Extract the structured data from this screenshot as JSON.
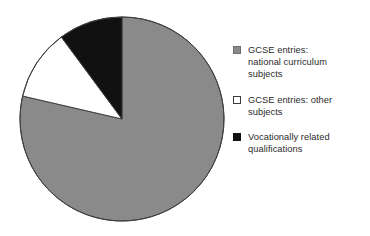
{
  "chart_data": {
    "type": "pie",
    "title": "",
    "subtitle": "",
    "xlabel": "",
    "ylabel": "",
    "grid": false,
    "legend_position": "right",
    "start_angle_deg": 0,
    "direction": "clockwise",
    "categories": [
      "GCSE entries: national curriculum subjects",
      "GCSE entries: other subjects",
      "Vocationally related qualifications"
    ],
    "values": [
      78.6,
      11.3,
      10.1
    ],
    "value_unit": "percent",
    "slice_angles_deg": [
      283.0,
      40.5,
      36.5
    ],
    "colors": [
      "#8a8a8a",
      "#ffffff",
      "#111111"
    ],
    "annotations": []
  },
  "pie": {
    "center_x": 103,
    "center_y": 103,
    "radius": 102,
    "outline_color": "#3f3f3f",
    "slices": [
      {
        "name": "gcse-national-curriculum",
        "start_deg": 0,
        "end_deg": 283.0,
        "fill": "#8a8a8a"
      },
      {
        "name": "gcse-other-subjects",
        "start_deg": 283.0,
        "end_deg": 323.5,
        "fill": "#ffffff"
      },
      {
        "name": "vocationally-related-qualifications",
        "start_deg": 323.5,
        "end_deg": 360,
        "fill": "#111111"
      }
    ]
  },
  "legend": {
    "items": [
      {
        "label": "GCSE entries:\nnational curriculum\nsubjects",
        "swatch": "filled-gray",
        "swatch_name": "legend-swatch-gray"
      },
      {
        "label": "GCSE entries: other\nsubjects",
        "swatch": "filled-white",
        "swatch_name": "legend-swatch-white"
      },
      {
        "label": "Vocationally related\nqualifications",
        "swatch": "filled-black",
        "swatch_name": "legend-swatch-black"
      }
    ]
  },
  "colors": {
    "background": "#ffffff",
    "gray_slice": "#8a8a8a",
    "white_slice": "#ffffff",
    "black_slice": "#111111",
    "text": "#2b2b2b",
    "outline": "#3f3f3f"
  }
}
